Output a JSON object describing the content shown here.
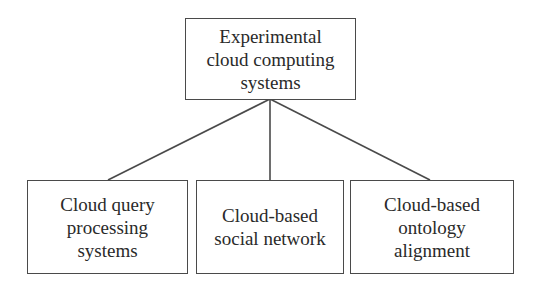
{
  "diagram": {
    "type": "hierarchy",
    "root": {
      "lines": [
        "Experimental",
        "cloud computing",
        "systems"
      ]
    },
    "children": [
      {
        "lines": [
          "Cloud query",
          "processing",
          "systems"
        ]
      },
      {
        "lines": [
          "Cloud-based",
          "social network"
        ]
      },
      {
        "lines": [
          "Cloud-based",
          "ontology",
          "alignment"
        ]
      }
    ],
    "colors": {
      "stroke": "#4a4a4a",
      "text": "#2a2a2a",
      "background": "#ffffff"
    }
  }
}
